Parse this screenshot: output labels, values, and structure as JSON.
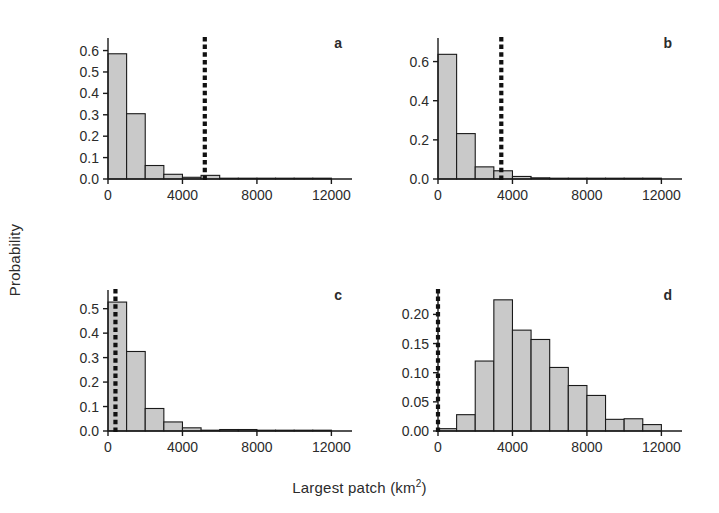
{
  "figure": {
    "xlabel": "Largest patch (km",
    "xlabel_sup": "2",
    "xlabel_close": ")",
    "ylabel": "Probability",
    "bar_fill": "#c9c9c9",
    "bar_stroke": "#1a1a1a",
    "axis_color": "#1a1a1a",
    "dashed_color": "#111111"
  },
  "chart_data": [
    {
      "type": "bar",
      "panel": "a",
      "title": "a",
      "xlabel": "Largest patch (km2)",
      "ylabel": "Probability",
      "xlim": [
        0,
        13000
      ],
      "ylim": [
        0.0,
        0.64
      ],
      "xticks": [
        0,
        4000,
        8000,
        12000
      ],
      "xticklabels": [
        "0",
        "4000",
        "8000",
        "12000"
      ],
      "yticks": [
        0.0,
        0.1,
        0.2,
        0.3,
        0.4,
        0.5,
        0.6
      ],
      "yticklabels": [
        "0.0",
        "0.1",
        "0.2",
        "0.3",
        "0.4",
        "0.5",
        "0.6"
      ],
      "grid": false,
      "bin_width": 1000,
      "bin_edges": [
        0,
        1000,
        2000,
        3000,
        4000,
        5000,
        6000,
        7000,
        8000,
        9000,
        10000,
        11000,
        12000
      ],
      "values": [
        0.585,
        0.305,
        0.063,
        0.022,
        0.008,
        0.017,
        0.0,
        0.0,
        0.0,
        0.0,
        0.003,
        0.003
      ],
      "annotations": [
        {
          "type": "vline",
          "label": "observed",
          "x": 5200,
          "style": "dotted-thick",
          "color": "#111111"
        }
      ]
    },
    {
      "type": "bar",
      "panel": "b",
      "title": "b",
      "xlabel": "Largest patch (km2)",
      "ylabel": "Probability",
      "xlim": [
        0,
        13000
      ],
      "ylim": [
        0.0,
        0.7
      ],
      "xticks": [
        0,
        4000,
        8000,
        12000
      ],
      "xticklabels": [
        "0",
        "4000",
        "8000",
        "12000"
      ],
      "yticks": [
        0.0,
        0.2,
        0.4,
        0.6
      ],
      "yticklabels": [
        "0.0",
        "0.2",
        "0.4",
        "0.6"
      ],
      "grid": false,
      "bin_width": 1000,
      "bin_edges": [
        0,
        1000,
        2000,
        3000,
        4000,
        5000,
        6000,
        7000,
        8000,
        9000,
        10000,
        11000,
        12000
      ],
      "values": [
        0.637,
        0.232,
        0.062,
        0.042,
        0.013,
        0.006,
        0.003,
        0.0,
        0.0,
        0.0,
        0.0,
        0.0
      ],
      "annotations": [
        {
          "type": "vline",
          "label": "observed",
          "x": 3400,
          "style": "dotted-thick",
          "color": "#111111"
        }
      ]
    },
    {
      "type": "bar",
      "panel": "c",
      "title": "c",
      "xlabel": "Largest patch (km2)",
      "ylabel": "Probability",
      "xlim": [
        0,
        13000
      ],
      "ylim": [
        0.0,
        0.56
      ],
      "xticks": [
        0,
        4000,
        8000,
        12000
      ],
      "xticklabels": [
        "0",
        "4000",
        "8000",
        "12000"
      ],
      "yticks": [
        0.0,
        0.1,
        0.2,
        0.3,
        0.4,
        0.5
      ],
      "yticklabels": [
        "0.0",
        "0.1",
        "0.2",
        "0.3",
        "0.4",
        "0.5"
      ],
      "grid": false,
      "bin_width": 1000,
      "bin_edges": [
        0,
        1000,
        2000,
        3000,
        4000,
        5000,
        6000,
        7000,
        8000,
        9000,
        10000,
        11000,
        12000
      ],
      "values": [
        0.527,
        0.325,
        0.092,
        0.037,
        0.013,
        0.0,
        0.006,
        0.006,
        0.0,
        0.0,
        0.0,
        0.0
      ],
      "annotations": [
        {
          "type": "vline",
          "label": "observed",
          "x": 400,
          "style": "dotted-thick",
          "color": "#111111"
        }
      ]
    },
    {
      "type": "bar",
      "panel": "d",
      "title": "d",
      "xlabel": "Largest patch (km2)",
      "ylabel": "Probability",
      "xlim": [
        0,
        13000
      ],
      "ylim": [
        0.0,
        0.235
      ],
      "xticks": [
        0,
        4000,
        8000,
        12000
      ],
      "xticklabels": [
        "0",
        "4000",
        "8000",
        "12000"
      ],
      "yticks": [
        0.0,
        0.05,
        0.1,
        0.15,
        0.2
      ],
      "yticklabels": [
        "0.00",
        "0.05",
        "0.10",
        "0.15",
        "0.20"
      ],
      "grid": false,
      "bin_width": 1000,
      "bin_edges": [
        0,
        1000,
        2000,
        3000,
        4000,
        5000,
        6000,
        7000,
        8000,
        9000,
        10000,
        11000,
        12000
      ],
      "values": [
        0.004,
        0.028,
        0.12,
        0.225,
        0.173,
        0.157,
        0.109,
        0.078,
        0.061,
        0.02,
        0.021,
        0.011
      ],
      "annotations": [
        {
          "type": "vline",
          "label": "observed",
          "x": 0,
          "style": "dotted-thick",
          "color": "#111111"
        }
      ]
    }
  ]
}
